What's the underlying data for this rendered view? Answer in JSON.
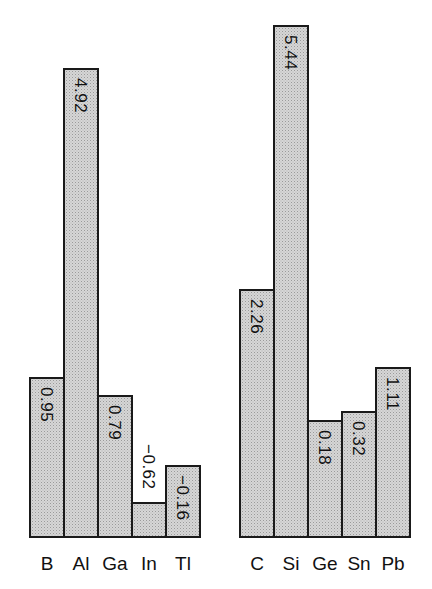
{
  "chart_data": {
    "type": "bar",
    "title": "",
    "xlabel": "",
    "ylabel": "",
    "grid": false,
    "legend": null,
    "groups": [
      {
        "name": "Group 13",
        "categories": [
          "B",
          "Al",
          "Ga",
          "In",
          "Tl"
        ],
        "values": [
          0.95,
          4.92,
          0.79,
          -0.62,
          -0.16
        ],
        "labels": [
          "0.95",
          "4.92",
          "0.79",
          "−0.62",
          "−0.16"
        ],
        "bar_top_px": [
          377,
          68,
          395,
          502,
          465
        ]
      },
      {
        "name": "Group 14",
        "categories": [
          "C",
          "Si",
          "Ge",
          "Sn",
          "Pb"
        ],
        "values": [
          2.26,
          5.44,
          0.18,
          0.32,
          1.11
        ],
        "labels": [
          "2.26",
          "5.44",
          "0.18",
          "0.32",
          "1.11"
        ],
        "bar_top_px": [
          289,
          25,
          420,
          411,
          367
        ]
      }
    ],
    "layout": {
      "baseline_px": 538,
      "group_left_px": [
        29,
        239
      ],
      "bar_width_px": 34,
      "fill": "#d6d6d6",
      "stroke": "#1a1a1a"
    }
  }
}
